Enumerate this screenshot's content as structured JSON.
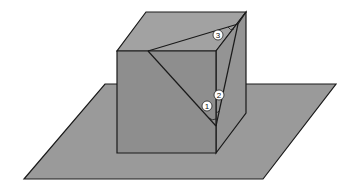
{
  "figure": {
    "colors": {
      "plane": "#9a9a9a",
      "front_face": "#8e8e8e",
      "top_face": "#a2a2a2",
      "right_face": "#949494",
      "edge": "#1a1a1a",
      "background": "#ffffff"
    },
    "labels": [
      {
        "id": "angle-1",
        "text": "1",
        "x": 207,
        "y": 106
      },
      {
        "id": "angle-2",
        "text": "2",
        "x": 219,
        "y": 95
      },
      {
        "id": "angle-3",
        "text": "3",
        "x": 218,
        "y": 35
      }
    ]
  }
}
